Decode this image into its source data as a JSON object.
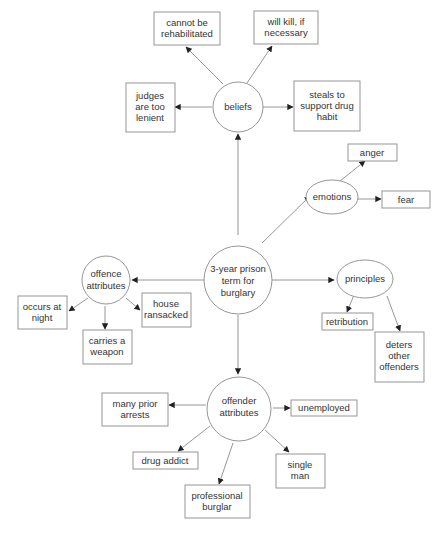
{
  "diagram": {
    "type": "concept-map",
    "center": {
      "id": "center",
      "shape": "circle",
      "lines": [
        "3-year prison",
        "term for",
        "burglary"
      ]
    },
    "hubs": [
      {
        "id": "beliefs",
        "shape": "circle",
        "lines": [
          "beliefs"
        ]
      },
      {
        "id": "emotions",
        "shape": "ellipse",
        "lines": [
          "emotions"
        ]
      },
      {
        "id": "principles",
        "shape": "ellipse",
        "lines": [
          "principles"
        ]
      },
      {
        "id": "offence",
        "shape": "circle",
        "lines": [
          "offence",
          "attributes"
        ]
      },
      {
        "id": "offender",
        "shape": "circle",
        "lines": [
          "offender",
          "attributes"
        ]
      }
    ],
    "leaves": {
      "beliefs": [
        {
          "id": "rehab",
          "lines": [
            "cannot be",
            "rehabilitated"
          ]
        },
        {
          "id": "kill",
          "lines": [
            "will kill, if",
            "necessary"
          ]
        },
        {
          "id": "judges",
          "lines": [
            "judges",
            "are too",
            "lenient"
          ]
        },
        {
          "id": "steals",
          "lines": [
            "steals to",
            "support drug",
            "habit"
          ]
        }
      ],
      "emotions": [
        {
          "id": "anger",
          "lines": [
            "anger"
          ]
        },
        {
          "id": "fear",
          "lines": [
            "fear"
          ]
        }
      ],
      "principles": [
        {
          "id": "retribution",
          "lines": [
            "retribution"
          ]
        },
        {
          "id": "deters",
          "lines": [
            "deters",
            "other",
            "offenders"
          ]
        }
      ],
      "offence": [
        {
          "id": "night",
          "lines": [
            "occurs at",
            "night"
          ]
        },
        {
          "id": "weapon",
          "lines": [
            "carries a",
            "weapon"
          ]
        },
        {
          "id": "ransacked",
          "lines": [
            "house",
            "ransacked"
          ]
        }
      ],
      "offender": [
        {
          "id": "arrests",
          "lines": [
            "many prior",
            "arrests"
          ]
        },
        {
          "id": "unemployed",
          "lines": [
            "unemployed"
          ]
        },
        {
          "id": "addict",
          "lines": [
            "drug addict"
          ]
        },
        {
          "id": "professional",
          "lines": [
            "professional",
            "burglar"
          ]
        },
        {
          "id": "single",
          "lines": [
            "single",
            "man"
          ]
        }
      ]
    },
    "colors": {
      "stroke": "#8a8a8a",
      "text": "#333333",
      "arrowhead": "#222222",
      "background": "#ffffff"
    }
  }
}
